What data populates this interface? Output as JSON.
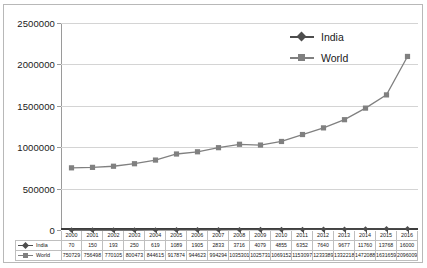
{
  "chart_data": {
    "type": "line",
    "title": "",
    "xlabel": "",
    "ylabel": "",
    "categories": [
      "2000",
      "2001",
      "2002",
      "2003",
      "2004",
      "2005",
      "2006",
      "2007",
      "2008",
      "2009",
      "2010",
      "2011",
      "2012",
      "2013",
      "2014",
      "2015",
      "2016"
    ],
    "series": [
      {
        "name": "India",
        "color": "#4d4d4d",
        "marker": "diamond",
        "values": [
          70,
          150,
          193,
          250,
          619,
          1089,
          1905,
          2833,
          3716,
          4079,
          4855,
          6352,
          7640,
          9677,
          11760,
          13768,
          16000
        ]
      },
      {
        "name": "World",
        "color": "#808080",
        "marker": "square",
        "values": [
          750729,
          756498,
          770105,
          800473,
          844615,
          917874,
          944623,
          994294,
          1035301,
          1025731,
          1069152,
          1153097,
          1233389,
          1332218,
          1472088,
          1631659,
          2096009
        ]
      }
    ],
    "y_ticks": [
      "0",
      "500000",
      "1000000",
      "1500000",
      "2000000",
      "2500000"
    ],
    "ylim": [
      0,
      2500000
    ],
    "grid": true,
    "legend_position": "top-right"
  },
  "legend": {
    "items": [
      {
        "label": "India"
      },
      {
        "label": "World"
      }
    ]
  },
  "table": {
    "row_labels": [
      "India",
      "World"
    ]
  },
  "colors": {
    "india": "#4d4d4d",
    "world": "#808080",
    "grid": "#d4d4d4",
    "axis": "#3d3d3d",
    "border": "#b8b8b8"
  }
}
